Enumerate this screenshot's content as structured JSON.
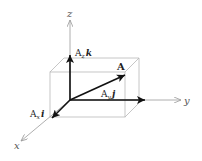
{
  "diagram": {
    "axes": {
      "x": {
        "label": "x"
      },
      "y": {
        "label": "y"
      },
      "z": {
        "label": "z"
      }
    },
    "vectors": {
      "A": {
        "label": "A"
      },
      "Ax": {
        "coef": "A",
        "sub": "x",
        "unit": "i"
      },
      "Ay": {
        "coef": "A",
        "sub": "y",
        "unit": "j"
      },
      "Az": {
        "coef": "A",
        "sub": "z",
        "unit": "k"
      }
    },
    "colors": {
      "axis": "#9a9a9a",
      "box": "#b8b8b8",
      "vector": "#111111"
    }
  }
}
